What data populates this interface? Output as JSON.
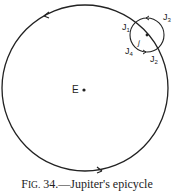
{
  "figure": {
    "labels": {
      "earth": "E",
      "j1": "J",
      "j1_sub": "1",
      "j2": "J",
      "j2_sub": "2",
      "j3": "J",
      "j3_sub": "3",
      "j4": "J",
      "j4_sub": "4",
      "center": "j"
    },
    "caption": {
      "fig_prefix_big": "F",
      "fig_prefix_small": "IG.",
      "number": " 34.",
      "text": "—Jupiter's epicycle"
    },
    "colors": {
      "line": "#222222",
      "background": "#ffffff"
    }
  }
}
